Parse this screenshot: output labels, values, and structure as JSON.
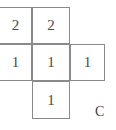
{
  "figure": {
    "label": "C",
    "label_position": {
      "x": 95,
      "y": 105
    },
    "canvas": {
      "width": 116,
      "height": 130
    },
    "colors": {
      "grid_line": "#8a8a8a",
      "cell_background": "#ffffff",
      "digit_text": "#4a4a4a",
      "label_text": "#3f3f3f",
      "page_background": "#ffffff"
    },
    "grid": {
      "x_lines": [
        0,
        32,
        70,
        105
      ],
      "y_lines": [
        7,
        44,
        81,
        119
      ],
      "column_widths": [
        32,
        38,
        35
      ],
      "row_heights": [
        37,
        37,
        38
      ],
      "left_edge_clipped": true
    },
    "cells": [
      {
        "name": "cell-r0-c0",
        "value": "2",
        "row": 0,
        "col": 0,
        "x": -1,
        "y": 7,
        "w": 33,
        "h": 37
      },
      {
        "name": "cell-r0-c1",
        "value": "2",
        "row": 0,
        "col": 1,
        "x": 32,
        "y": 7,
        "w": 38,
        "h": 37
      },
      {
        "name": "cell-r1-c0",
        "value": "1",
        "row": 1,
        "col": 0,
        "x": -1,
        "y": 44,
        "w": 33,
        "h": 37
      },
      {
        "name": "cell-r1-c1",
        "value": "1",
        "row": 1,
        "col": 1,
        "x": 32,
        "y": 44,
        "w": 38,
        "h": 37
      },
      {
        "name": "cell-r1-c2",
        "value": "1",
        "row": 1,
        "col": 2,
        "x": 70,
        "y": 44,
        "w": 35,
        "h": 37
      },
      {
        "name": "cell-r2-c1",
        "value": "1",
        "row": 2,
        "col": 1,
        "x": 32,
        "y": 81,
        "w": 38,
        "h": 38
      }
    ]
  }
}
